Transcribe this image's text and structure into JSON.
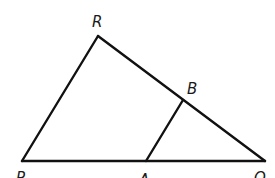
{
  "diagram": {
    "type": "geometry-triangle",
    "points": {
      "R": {
        "label": "R",
        "x": 98,
        "y": 36
      },
      "P": {
        "label": "P",
        "x": 22,
        "y": 161
      },
      "Q": {
        "label": "Q",
        "x": 265,
        "y": 161
      },
      "A": {
        "label": "A",
        "x": 146,
        "y": 161
      },
      "B": {
        "label": "B",
        "x": 183,
        "y": 100
      }
    },
    "segments": [
      {
        "name": "PR",
        "from": "P",
        "to": "R"
      },
      {
        "name": "RQ",
        "from": "R",
        "to": "Q"
      },
      {
        "name": "PQ",
        "from": "P",
        "to": "Q"
      },
      {
        "name": "AB",
        "from": "A",
        "to": "B"
      }
    ],
    "labels": {
      "R": "R",
      "B": "B",
      "P": "P",
      "A": "A",
      "Q": "Q"
    },
    "line_color": "#111111",
    "background": "#ffffff"
  }
}
